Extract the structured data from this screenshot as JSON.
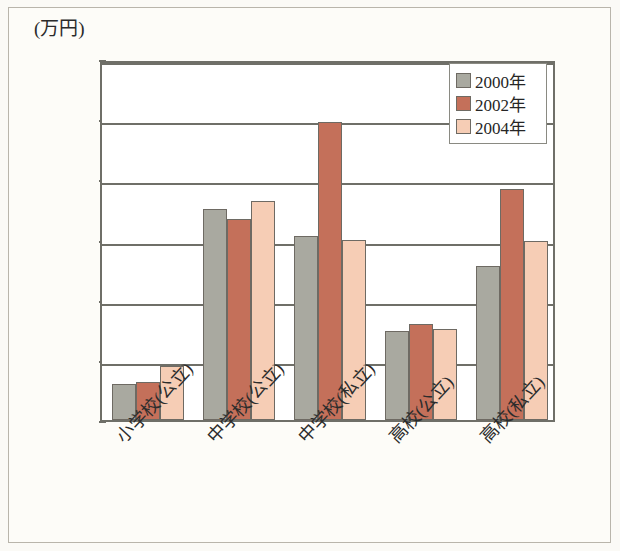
{
  "figure": {
    "unit_label": "(万円)",
    "background_color": "#fdfcf8",
    "frame_color": "#b9b5ab",
    "axis_color": "#6f6f68"
  },
  "legend": {
    "position": "top-right",
    "entries": [
      {
        "label": "2000年",
        "color": "#a9a9a0",
        "swatch": "legend-swatch-2000"
      },
      {
        "label": "2002年",
        "color": "#c4705a",
        "swatch": "legend-swatch-2002"
      },
      {
        "label": "2004年",
        "color": "#f6cdb5",
        "swatch": "legend-swatch-2004"
      }
    ]
  },
  "chart_data": {
    "type": "bar",
    "title": "",
    "xlabel": "",
    "ylabel": "(万円)",
    "ylim": [
      5,
      35
    ],
    "yticks": [
      5,
      10,
      15,
      20,
      25,
      30,
      35
    ],
    "ytick_labels": [
      "5",
      "10",
      "15",
      "20",
      "25",
      "30",
      "35"
    ],
    "grid": true,
    "grid_axis": "y",
    "legend_position": "upper right",
    "categories": [
      "小学校(公立)",
      "中学校(公立)",
      "中学校(私立)",
      "高校(公立)",
      "高校(私立)"
    ],
    "series": [
      {
        "name": "2000年",
        "color": "#a9a9a0",
        "values": [
          8.0,
          22.5,
          20.3,
          12.4,
          17.8
        ]
      },
      {
        "name": "2002年",
        "color": "#c4705a",
        "values": [
          8.2,
          21.7,
          29.8,
          13.0,
          24.2
        ]
      },
      {
        "name": "2004年",
        "color": "#f6cdb5",
        "values": [
          9.5,
          23.2,
          20.0,
          12.6,
          19.9
        ]
      }
    ]
  }
}
